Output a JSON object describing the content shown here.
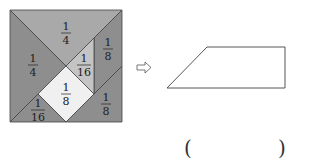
{
  "tangram": {
    "colors": {
      "dark": "#8e8e8e",
      "medium": "#a9a9a9",
      "light": "#c4c4c4",
      "white": "#f0f0f0",
      "stroke": "#444444"
    },
    "pieces": [
      {
        "name": "top-large-triangle",
        "fraction_num": "1",
        "fraction_den": "4"
      },
      {
        "name": "left-large-triangle",
        "fraction_num": "1",
        "fraction_den": "4"
      },
      {
        "name": "right-parallelogram",
        "fraction_num": "1",
        "fraction_den": "8"
      },
      {
        "name": "center-small-triangle",
        "fraction_num": "1",
        "fraction_den": "16"
      },
      {
        "name": "center-square",
        "fraction_num": "1",
        "fraction_den": "8"
      },
      {
        "name": "bottom-left-small-triangle",
        "fraction_num": "1",
        "fraction_den": "16"
      },
      {
        "name": "bottom-right-medium-triangle",
        "fraction_num": "1",
        "fraction_den": "8"
      }
    ]
  },
  "arrow": {
    "icon": "hollow-right-arrow-icon"
  },
  "answer": {
    "open_paren": "(",
    "close_paren": ")",
    "value": ""
  }
}
